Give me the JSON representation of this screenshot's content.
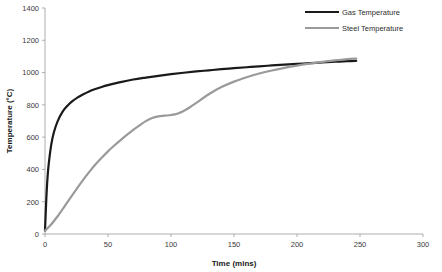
{
  "chart_data": {
    "type": "line",
    "title": "",
    "xlabel": "Time (mins)",
    "ylabel": "Temperature (°C)",
    "xlim": [
      0,
      300
    ],
    "ylim": [
      0,
      1400
    ],
    "xticks": [
      0,
      50,
      100,
      150,
      200,
      250,
      300
    ],
    "yticks": [
      0,
      200,
      400,
      600,
      800,
      1000,
      1200,
      1400
    ],
    "xtick_labels": [
      "0",
      "50",
      "100",
      "150",
      "200",
      "250",
      "300"
    ],
    "ytick_labels": [
      "0",
      "200",
      "400",
      "600",
      "800",
      "1000",
      "1200",
      "1400"
    ],
    "grid": false,
    "legend_position": "top-right",
    "series": [
      {
        "name": "Gas Temperature",
        "color": "#1a1a1a",
        "width": 2.2,
        "x": [
          0,
          1,
          2,
          3,
          5,
          7,
          10,
          14,
          18,
          22,
          26,
          30,
          35,
          40,
          45,
          50,
          60,
          70,
          80,
          90,
          100,
          110,
          120,
          130,
          140,
          150,
          160,
          170,
          180,
          190,
          200,
          210,
          220,
          230,
          240,
          247
        ],
        "y": [
          20,
          210,
          349,
          437,
          555,
          629,
          698,
          758,
          796,
          824,
          846,
          864,
          883,
          898,
          911,
          922,
          941,
          957,
          969,
          980,
          990,
          999,
          1007,
          1014,
          1021,
          1027,
          1033,
          1039,
          1044,
          1049,
          1054,
          1058,
          1063,
          1067,
          1071,
          1073
        ]
      },
      {
        "name": "Steel Temperature",
        "color": "#9a9a9a",
        "width": 2.2,
        "x": [
          0,
          5,
          10,
          15,
          20,
          25,
          30,
          35,
          40,
          45,
          50,
          55,
          60,
          65,
          70,
          75,
          80,
          85,
          90,
          95,
          100,
          105,
          110,
          115,
          120,
          130,
          140,
          150,
          160,
          170,
          180,
          190,
          200,
          210,
          220,
          230,
          240,
          247
        ],
        "y": [
          20,
          60,
          110,
          165,
          222,
          278,
          332,
          383,
          430,
          472,
          512,
          548,
          582,
          614,
          645,
          673,
          699,
          719,
          729,
          733,
          737,
          745,
          762,
          785,
          812,
          866,
          910,
          944,
          971,
          994,
          1013,
          1029,
          1043,
          1055,
          1066,
          1075,
          1083,
          1087
        ]
      }
    ],
    "annotations": {
      "series_end_time": 247,
      "gas_end_value": 1160,
      "steel_end_value": 1100,
      "steel_plateau_value": 735
    }
  },
  "legend": {
    "items": [
      {
        "label": "Gas Temperature",
        "color": "#1a1a1a"
      },
      {
        "label": "Steel Temperature",
        "color": "#9a9a9a"
      }
    ]
  },
  "axes": {
    "x_title": "Time (mins)",
    "y_title": "Temperature (°C)"
  }
}
